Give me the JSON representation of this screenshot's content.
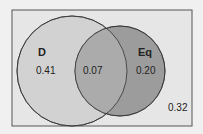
{
  "diagram": {
    "type": "venn",
    "sets": [
      {
        "name": "D",
        "only_value": "0.41",
        "fill": "#cfcfcf"
      },
      {
        "name": "Eq",
        "only_value": "0.20",
        "fill": "#9a9a9a"
      }
    ],
    "intersection_value": "0.07",
    "outside_value": "0.32",
    "colors": {
      "background": "#e6e6e6",
      "frame": "#555555",
      "intersection": "#a8a8a8",
      "stroke": "#333333"
    }
  }
}
